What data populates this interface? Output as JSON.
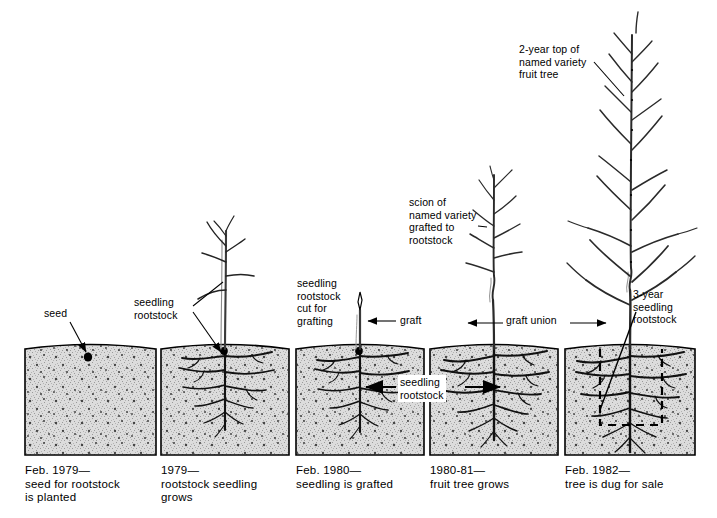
{
  "diagram": {
    "type": "process-timeline",
    "colors": {
      "ink": "#000000",
      "soil_fill": "#d8d8d8",
      "soil_outline": "#000000",
      "background": "#ffffff",
      "callout_bg": "#ffffff"
    }
  },
  "panels": [
    {
      "id": "panel-1",
      "caption": "Feb. 1979—\nseed for rootstock\nis planted",
      "stage_year": "Feb. 1979",
      "x": 25,
      "y": 343,
      "w": 131,
      "h": 112,
      "has_plant": false,
      "has_roots": false
    },
    {
      "id": "panel-2",
      "caption": "1979—\nrootstock seedling\ngrows",
      "stage_year": "1979",
      "x": 161,
      "y": 343,
      "w": 128,
      "h": 112,
      "has_plant": true,
      "has_roots": true
    },
    {
      "id": "panel-3",
      "caption": "Feb. 1980—\nseedling is grafted",
      "stage_year": "Feb. 1980",
      "x": 296,
      "y": 343,
      "w": 128,
      "h": 112,
      "has_plant": true,
      "has_roots": true
    },
    {
      "id": "panel-4",
      "caption": "1980-81—\nfruit tree grows",
      "stage_year": "1980-81",
      "x": 430,
      "y": 343,
      "w": 128,
      "h": 112,
      "has_plant": true,
      "has_roots": true
    },
    {
      "id": "panel-5",
      "caption": "Feb. 1982—\ntree is dug for sale",
      "stage_year": "Feb. 1982",
      "x": 565,
      "y": 343,
      "w": 130,
      "h": 112,
      "has_plant": true,
      "has_roots": true
    }
  ],
  "labels": [
    {
      "id": "label-seed",
      "text": "seed",
      "x": 44,
      "y": 313
    },
    {
      "id": "label-seedling-rootstock-1",
      "text": "seedling\nrootstock",
      "x": 140,
      "y": 302
    },
    {
      "id": "label-cut-for-grafting",
      "text": "seedling\nrootstock\ncut for\ngrafting",
      "x": 297,
      "y": 278
    },
    {
      "id": "label-graft",
      "text": "graft",
      "x": 400,
      "y": 316
    },
    {
      "id": "label-scion",
      "text": "scion of\nnamed variety\ngrafted to\nrootstock",
      "x": 409,
      "y": 196
    },
    {
      "id": "label-graft-union",
      "text": "graft union",
      "x": 506,
      "y": 316
    },
    {
      "id": "label-seedling-rootstock-2",
      "text": "seedling\nrootstock",
      "x": 397,
      "y": 377
    },
    {
      "id": "label-2year-top",
      "text": "2-year top of\nnamed variety\nfruit tree",
      "x": 519,
      "y": 43
    },
    {
      "id": "label-3year-rootstock",
      "text": "3-year\nseedling\nrootstock",
      "x": 632,
      "y": 288
    }
  ],
  "annotations": {
    "graft_union_double_arrow": true,
    "dig_line_style": "dashed",
    "seed_marker": "black-oval"
  }
}
